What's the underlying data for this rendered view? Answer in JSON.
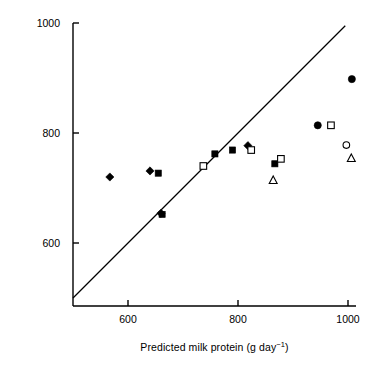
{
  "chart_data": {
    "type": "scatter",
    "title": "",
    "xlabel": "Predicted milk protein (g day⁻¹)",
    "ylabel": "Observed milk protein (g day⁻¹)",
    "xlim": [
      500,
      1030
    ],
    "ylim": [
      500,
      1000
    ],
    "xticks": [
      600,
      800,
      1000
    ],
    "yticks": [
      600,
      800,
      1000
    ],
    "xtick_labels": [
      "600",
      "800",
      "1000"
    ],
    "ytick_labels": [
      "600",
      "800",
      "1000"
    ],
    "grid": false,
    "legend": "none",
    "annotations": [
      {
        "name": "identity-line",
        "description": "y = x reference line",
        "from": [
          500,
          500
        ],
        "to": [
          995,
          995
        ]
      }
    ],
    "series": [
      {
        "name": "filled-diamond",
        "marker": "filled-diamond",
        "color": "#000000",
        "points": [
          {
            "x": 567,
            "y": 720
          },
          {
            "x": 640,
            "y": 731
          },
          {
            "x": 660,
            "y": 654
          },
          {
            "x": 818,
            "y": 777
          }
        ]
      },
      {
        "name": "filled-square",
        "marker": "filled-square",
        "color": "#000000",
        "points": [
          {
            "x": 655,
            "y": 727
          },
          {
            "x": 662,
            "y": 652
          },
          {
            "x": 758,
            "y": 762
          },
          {
            "x": 790,
            "y": 769
          },
          {
            "x": 867,
            "y": 744
          }
        ]
      },
      {
        "name": "open-square",
        "marker": "open-square",
        "color": "#000000",
        "points": [
          {
            "x": 737,
            "y": 740
          },
          {
            "x": 824,
            "y": 769
          },
          {
            "x": 878,
            "y": 753
          },
          {
            "x": 969,
            "y": 814
          }
        ]
      },
      {
        "name": "filled-circle",
        "marker": "filled-circle",
        "color": "#000000",
        "points": [
          {
            "x": 945,
            "y": 814
          },
          {
            "x": 1007,
            "y": 898
          }
        ]
      },
      {
        "name": "open-circle",
        "marker": "open-circle",
        "color": "#000000",
        "points": [
          {
            "x": 997,
            "y": 778
          }
        ]
      },
      {
        "name": "open-triangle",
        "marker": "open-triangle",
        "color": "#000000",
        "points": [
          {
            "x": 864,
            "y": 714
          },
          {
            "x": 1006,
            "y": 754
          }
        ]
      }
    ]
  },
  "axes": {
    "y_label_text": "Observed milk protein (g day",
    "y_label_sup": "−1",
    "y_label_tail": ")",
    "x_label_text": "Predicted milk protein (g day",
    "x_label_sup": "−1",
    "x_label_tail": ")",
    "ytick_1000": "1000",
    "ytick_800": "800",
    "ytick_600": "600",
    "xtick_600": "600",
    "xtick_800": "800",
    "xtick_1000": "1000"
  },
  "colors": {
    "axis": "#000000",
    "marker": "#000000",
    "background": "#ffffff"
  }
}
